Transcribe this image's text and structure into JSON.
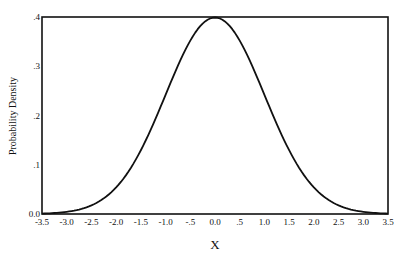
{
  "chart_data": {
    "type": "line",
    "title": "",
    "xlabel": "X",
    "ylabel": "Probability Density",
    "xlim": [
      -3.5,
      3.5
    ],
    "ylim": [
      0.0,
      0.4
    ],
    "grid": false,
    "legend": null,
    "x_ticks": [
      "-3.5",
      "-3.0",
      "-2.5",
      "-2.0",
      "-1.5",
      "-1.0",
      "-.5",
      "0.0",
      ".5",
      "1.0",
      "1.5",
      "2.0",
      "2.5",
      "3.0",
      "3.5"
    ],
    "y_ticks": [
      "0.0",
      ".1",
      ".2",
      ".3",
      ".4"
    ],
    "x_tick_values": [
      -3.5,
      -3.0,
      -2.5,
      -2.0,
      -1.5,
      -1.0,
      -0.5,
      0.0,
      0.5,
      1.0,
      1.5,
      2.0,
      2.5,
      3.0,
      3.5
    ],
    "y_tick_values": [
      0.0,
      0.1,
      0.2,
      0.3,
      0.4
    ],
    "series": [
      {
        "name": "Standard normal density",
        "x": [
          -3.5,
          -3.0,
          -2.5,
          -2.0,
          -1.5,
          -1.0,
          -0.5,
          0.0,
          0.5,
          1.0,
          1.5,
          2.0,
          2.5,
          3.0,
          3.5
        ],
        "values": [
          0.0009,
          0.0044,
          0.0175,
          0.054,
          0.1295,
          0.242,
          0.3521,
          0.3989,
          0.3521,
          0.242,
          0.1295,
          0.054,
          0.0175,
          0.0044,
          0.0009
        ]
      }
    ],
    "colors": {
      "line": "#111111",
      "frame": "#111111",
      "background": "#ffffff"
    }
  }
}
